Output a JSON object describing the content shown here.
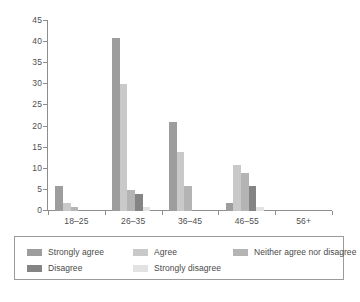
{
  "chart_data": {
    "type": "bar",
    "title": "",
    "xlabel": "",
    "ylabel": "",
    "ylim": [
      0,
      45
    ],
    "ytick_step": 5,
    "yticks": [
      "0",
      "5",
      "10",
      "15",
      "20",
      "25",
      "30",
      "35",
      "40",
      "45"
    ],
    "grid": false,
    "legend_position": "bottom",
    "categories": [
      "18–25",
      "26–35",
      "36–45",
      "46–55",
      "56+"
    ],
    "series": [
      {
        "name": "Strongly agree",
        "color": "#9d9d9d",
        "values": [
          6,
          41,
          21,
          2,
          0
        ]
      },
      {
        "name": "Agree",
        "color": "#c9c9c9",
        "values": [
          2,
          30,
          14,
          11,
          0
        ]
      },
      {
        "name": "Neither agree nor disagree",
        "color": "#b4b4b4",
        "values": [
          1,
          5,
          6,
          9,
          0
        ]
      },
      {
        "name": "Disagree",
        "color": "#848484",
        "values": [
          0,
          4,
          0,
          6,
          0
        ]
      },
      {
        "name": "Strongly disagree",
        "color": "#e2e2e2",
        "values": [
          0,
          1,
          0,
          1,
          0
        ]
      }
    ]
  },
  "legend": {
    "items": [
      {
        "label": "Strongly agree",
        "color": "#9d9d9d"
      },
      {
        "label": "Agree",
        "color": "#c9c9c9"
      },
      {
        "label": "Neither agree nor disagree",
        "color": "#b4b4b4"
      },
      {
        "label": "Disagree",
        "color": "#848484"
      },
      {
        "label": "Strongly disagree",
        "color": "#e2e2e2"
      }
    ]
  },
  "axis": {
    "line_color": "#8d8d8d",
    "text_color": "#4f4f4f"
  }
}
